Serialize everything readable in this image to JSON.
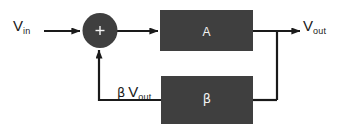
{
  "diagram": {
    "background_color": "#ffffff",
    "line_color": "#1a1a1a",
    "block_fill_color": "#3f3f3f",
    "block_text_color": "#f2f2f2",
    "label_text_color": "#1a1a1a"
  },
  "labels": {
    "input": {
      "base": "V",
      "sub": "in",
      "full": "V in"
    },
    "output": {
      "base": "V",
      "sub": "out",
      "full": "V out"
    },
    "feedback": {
      "beta": "β",
      "base": "V",
      "sub": "out",
      "full": "β V out"
    }
  },
  "blocks": [
    {
      "id": "gain",
      "label": "A",
      "name": "gain-block"
    },
    {
      "id": "feedback",
      "label": "β",
      "name": "feedback-block"
    }
  ],
  "summing_junction": {
    "sign": "+",
    "name": "summing-junction"
  },
  "connections": [
    {
      "name": "input-arrow",
      "from": "V in",
      "to": "summing junction"
    },
    {
      "name": "summer-to-gain-arrow",
      "from": "summing junction",
      "to": "A"
    },
    {
      "name": "gain-to-output-arrow",
      "from": "A",
      "to": "V out"
    },
    {
      "name": "output-tap-to-feedback",
      "from": "V out node",
      "to": "β"
    },
    {
      "name": "feedback-to-summer-arrow",
      "from": "β",
      "to": "summing junction"
    }
  ]
}
